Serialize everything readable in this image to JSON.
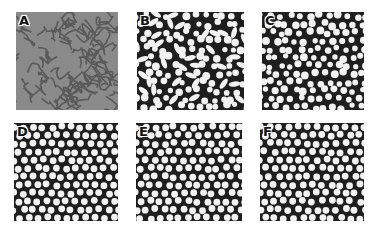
{
  "figure": {
    "panels": [
      {
        "id": "A",
        "label": "A",
        "pattern": "labyrinth",
        "x": 16,
        "y": 12,
        "w": 102,
        "h": 98,
        "bg": "#8a8a8a",
        "fg": "#5a5a5a"
      },
      {
        "id": "B",
        "label": "B",
        "pattern": "mixed-spots-stripes",
        "x": 137,
        "y": 12,
        "w": 107,
        "h": 98,
        "bg": "#1e1e1e",
        "fg": "#f2f2f2"
      },
      {
        "id": "C",
        "label": "C",
        "pattern": "spots-disordered",
        "x": 262,
        "y": 12,
        "w": 102,
        "h": 98,
        "bg": "#1e1e1e",
        "fg": "#f2f2f2"
      },
      {
        "id": "D",
        "label": "D",
        "pattern": "hexagonal-spots",
        "x": 14,
        "y": 123,
        "w": 104,
        "h": 98,
        "bg": "#1e1e1e",
        "fg": "#f2f2f2"
      },
      {
        "id": "E",
        "label": "E",
        "pattern": "hexagonal-spots",
        "x": 136,
        "y": 123,
        "w": 106,
        "h": 98,
        "bg": "#1e1e1e",
        "fg": "#f2f2f2"
      },
      {
        "id": "F",
        "label": "F",
        "pattern": "hexagonal-spots",
        "x": 260,
        "y": 123,
        "w": 104,
        "h": 98,
        "bg": "#1e1e1e",
        "fg": "#f2f2f2"
      }
    ]
  }
}
